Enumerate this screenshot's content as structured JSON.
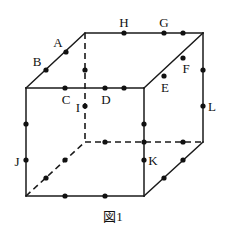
{
  "figure": {
    "caption": "図1",
    "colors": {
      "stroke": "#1a1a1a",
      "dot": "#111111",
      "background": "#ffffff",
      "text": "#111111"
    },
    "geometry": {
      "front_top_left": [
        26,
        88
      ],
      "front_top_right": [
        144,
        88
      ],
      "front_bottom_right": [
        144,
        196
      ],
      "front_bottom_left": [
        26,
        196
      ],
      "back_top_left": [
        85,
        33
      ],
      "back_top_right": [
        203,
        33
      ],
      "back_bottom_right": [
        203,
        142
      ],
      "back_bottom_left": [
        85,
        142
      ]
    },
    "solid_edges": [
      {
        "name": "front-top-edge",
        "from": [
          26,
          88
        ],
        "to": [
          144,
          88
        ]
      },
      {
        "name": "front-right-edge",
        "from": [
          144,
          88
        ],
        "to": [
          144,
          196
        ]
      },
      {
        "name": "front-bottom-edge",
        "from": [
          26,
          196
        ],
        "to": [
          144,
          196
        ]
      },
      {
        "name": "front-left-edge",
        "from": [
          26,
          88
        ],
        "to": [
          26,
          196
        ]
      },
      {
        "name": "back-top-edge",
        "from": [
          85,
          33
        ],
        "to": [
          203,
          33
        ]
      },
      {
        "name": "back-right-edge",
        "from": [
          203,
          33
        ],
        "to": [
          203,
          142
        ]
      },
      {
        "name": "top-left-connector",
        "from": [
          26,
          88
        ],
        "to": [
          85,
          33
        ]
      },
      {
        "name": "top-right-connector",
        "from": [
          144,
          88
        ],
        "to": [
          203,
          33
        ]
      },
      {
        "name": "bottom-right-connector",
        "from": [
          144,
          196
        ],
        "to": [
          203,
          142
        ]
      }
    ],
    "dashed_edges": [
      {
        "name": "hidden-back-left-vertical",
        "from": [
          85,
          33
        ],
        "to": [
          85,
          142
        ]
      },
      {
        "name": "hidden-back-bottom-edge",
        "from": [
          85,
          142
        ],
        "to": [
          203,
          142
        ]
      },
      {
        "name": "hidden-bottom-left-connector",
        "from": [
          26,
          196
        ],
        "to": [
          85,
          142
        ]
      }
    ],
    "labeled_points": [
      {
        "id": "A",
        "label": "A",
        "dot": [
          66,
          52
        ],
        "label_pos": [
          58,
          42
        ]
      },
      {
        "id": "B",
        "label": "B",
        "dot": [
          46,
          70
        ],
        "label_pos": [
          37,
          61
        ]
      },
      {
        "id": "C",
        "label": "C",
        "dot": [
          65,
          88
        ],
        "label_pos": [
          66,
          99
        ]
      },
      {
        "id": "D",
        "label": "D",
        "dot": [
          105,
          88
        ],
        "label_pos": [
          106,
          99
        ]
      },
      {
        "id": "E",
        "label": "E",
        "dot": [
          164,
          76
        ],
        "label_pos": [
          165,
          87
        ]
      },
      {
        "id": "F",
        "label": "F",
        "dot": [
          183,
          58
        ],
        "label_pos": [
          186,
          68
        ]
      },
      {
        "id": "G",
        "label": "G",
        "dot": [
          164,
          33
        ],
        "label_pos": [
          164,
          22
        ]
      },
      {
        "id": "H",
        "label": "H",
        "dot": [
          124,
          33
        ],
        "label_pos": [
          124,
          22
        ]
      },
      {
        "id": "I",
        "label": "I",
        "dot": [
          85,
          106
        ],
        "label_pos": [
          78,
          107
        ]
      },
      {
        "id": "J",
        "label": "J",
        "dot": [
          26,
          160
        ],
        "label_pos": [
          17,
          161
        ]
      },
      {
        "id": "K",
        "label": "K",
        "dot": [
          144,
          160
        ],
        "label_pos": [
          153,
          160
        ]
      },
      {
        "id": "L",
        "label": "L",
        "dot": [
          203,
          106
        ],
        "label_pos": [
          212,
          106
        ]
      }
    ],
    "unlabeled_dots": [
      [
        85,
        70
      ],
      [
        124,
        88
      ],
      [
        183,
        33
      ],
      [
        203,
        70
      ],
      [
        26,
        124
      ],
      [
        144,
        124
      ],
      [
        105,
        142
      ],
      [
        144,
        142
      ],
      [
        183,
        142
      ],
      [
        65,
        196
      ],
      [
        105,
        196
      ],
      [
        46,
        178
      ],
      [
        65,
        160
      ],
      [
        164,
        178
      ],
      [
        183,
        160
      ]
    ]
  }
}
